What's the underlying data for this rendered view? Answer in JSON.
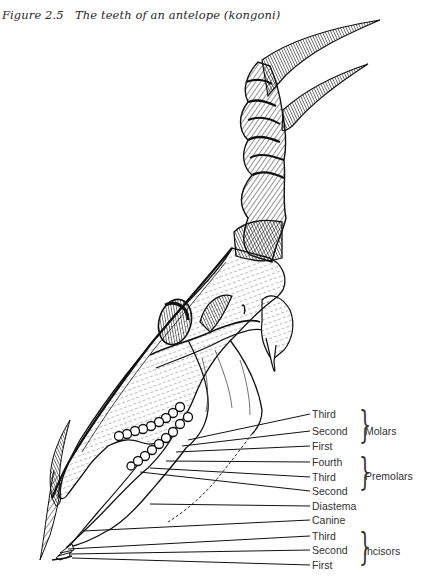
{
  "figure": {
    "number": "Figure 2.5",
    "title": "The teeth of an antelope (kongoni)"
  },
  "labels": {
    "molars": {
      "group": "Molars",
      "items": [
        "Third",
        "Second",
        "First"
      ]
    },
    "premolars": {
      "group": "Premolars",
      "items": [
        "Fourth",
        "Third",
        "Second"
      ]
    },
    "diastema": "Diastema",
    "canine": "Canine",
    "incisors": {
      "group": "Incisors",
      "items": [
        "Third",
        "Second",
        "First"
      ]
    }
  },
  "colors": {
    "ink": "#111111",
    "label_text": "#333333",
    "background": "#ffffff"
  }
}
